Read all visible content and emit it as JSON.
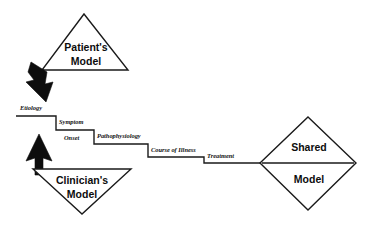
{
  "diagram": {
    "background_color": "#ffffff",
    "line_color": "#1a1a1a",
    "arrow_color": "#0d0d0d",
    "nodes": [
      {
        "id": "patients-model",
        "shape": "triangle-up",
        "line1": "Patient's",
        "line2": "Model"
      },
      {
        "id": "clinicians-model",
        "shape": "triangle-down",
        "line1": "Clinician's",
        "line2": "Model"
      },
      {
        "id": "shared-model",
        "shape": "diamond",
        "line1": "Shared",
        "line2": "Model"
      }
    ],
    "edge_labels": [
      {
        "id": "etiology",
        "text": "Etiology"
      },
      {
        "id": "symptom",
        "text": "Symptom"
      },
      {
        "id": "onset",
        "text": "Onset"
      },
      {
        "id": "pathophysiology",
        "text": "Pathophysiology"
      },
      {
        "id": "course-of-illness",
        "text": "Course of Illness"
      },
      {
        "id": "treatment",
        "text": "Treatment"
      }
    ],
    "arrows": [
      {
        "id": "patient-down-arrow",
        "direction": "down"
      },
      {
        "id": "clinician-up-arrow",
        "direction": "up"
      },
      {
        "id": "shared-model-arrowhead",
        "direction": "right"
      }
    ]
  }
}
